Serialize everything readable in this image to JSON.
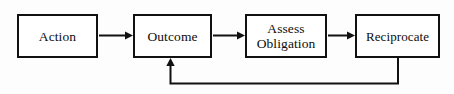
{
  "diagram": {
    "background_color": "#fdfdfd",
    "line_color": "#111111",
    "text_color": "#0d0d0d",
    "nodes": [
      {
        "id": "action",
        "label": "Action"
      },
      {
        "id": "outcome",
        "label": "Outcome"
      },
      {
        "id": "assess",
        "label": "Assess\nObligation"
      },
      {
        "id": "reciprocate",
        "label": "Reciprocate"
      }
    ],
    "edges": [
      {
        "id": "action-to-outcome",
        "from": "action",
        "to": "outcome",
        "style": "straight-arrow"
      },
      {
        "id": "outcome-to-assess",
        "from": "outcome",
        "to": "assess",
        "style": "straight-arrow"
      },
      {
        "id": "assess-to-reciprocate",
        "from": "assess",
        "to": "reciprocate",
        "style": "straight-arrow"
      },
      {
        "id": "reciprocate-to-outcome",
        "from": "reciprocate",
        "to": "outcome",
        "style": "feedback-loop-arrow"
      }
    ]
  }
}
